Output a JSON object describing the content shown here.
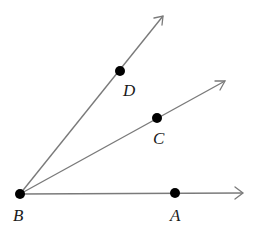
{
  "diagram": {
    "type": "geometry-rays",
    "vertex": {
      "label": "B",
      "x": 20,
      "y": 194
    },
    "points": [
      {
        "label": "A",
        "x": 175,
        "y": 193
      },
      {
        "label": "C",
        "x": 157,
        "y": 118
      },
      {
        "label": "D",
        "x": 120,
        "y": 71
      }
    ],
    "rays": [
      {
        "name": "BA",
        "through": "A"
      },
      {
        "name": "BC",
        "through": "C"
      },
      {
        "name": "BD",
        "through": "D"
      }
    ],
    "labels": {
      "B": "B",
      "A": "A",
      "C": "C",
      "D": "D"
    },
    "colors": {
      "ray": "#7a7a7a",
      "point": "#000000",
      "label": "#1a1a1a"
    }
  }
}
